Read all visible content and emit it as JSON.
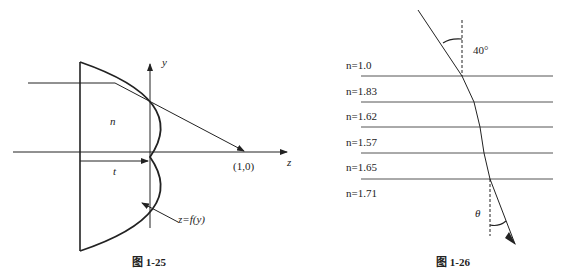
{
  "figure_left": {
    "caption": "图 1-25",
    "labels": {
      "y_axis": "y",
      "z_axis": "z",
      "index": "n",
      "thickness": "t",
      "focus_point": "(1,0)",
      "surface": "z=f(y)"
    }
  },
  "figure_right": {
    "caption": "图 1-26",
    "incident_angle": "40°",
    "exit_angle": "θ",
    "layers": [
      {
        "label": "n=1.0"
      },
      {
        "label": "n=1.83"
      },
      {
        "label": "n=1.62"
      },
      {
        "label": "n=1.57"
      },
      {
        "label": "n=1.65"
      },
      {
        "label": "n=1.71"
      }
    ]
  },
  "colors": {
    "stroke": "#222222",
    "background": "#ffffff"
  }
}
